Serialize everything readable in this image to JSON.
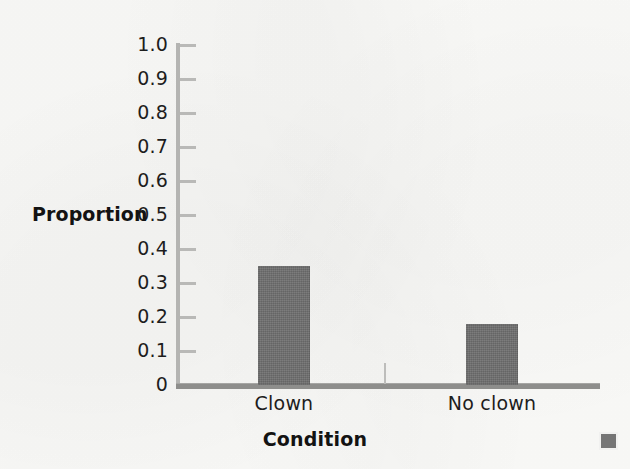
{
  "chart_data": {
    "type": "bar",
    "title": "",
    "subtitle": "",
    "categories": [
      "Clown",
      "No clown"
    ],
    "values": [
      0.35,
      0.18
    ],
    "series": [
      {
        "name": "Proportion",
        "values": [
          0.35,
          0.18
        ]
      }
    ],
    "xlabel": "Condition",
    "ylabel": "Proportion",
    "ylim": [
      0,
      1.0
    ],
    "ytick_labels": [
      "1.0",
      "0.9",
      "0.8",
      "0.7",
      "0.6",
      "0.5",
      "0.4",
      "0.3",
      "0.2",
      "0.1",
      "0"
    ],
    "ytick_values": [
      1.0,
      0.9,
      0.8,
      0.7,
      0.6,
      0.5,
      0.4,
      0.3,
      0.2,
      0.1,
      0
    ],
    "grid": false,
    "legend": false,
    "legend_position": "none",
    "annotations": [],
    "bar_color": "#6e6e6e",
    "axis_color": "#8e8e8c",
    "text_color": "#1d1d1d",
    "background_color": "#fbfbf9"
  },
  "axes": {
    "y_title": "Proportion",
    "x_title": "Condition"
  },
  "ticks": [
    {
      "label": "1.0",
      "value": 1.0
    },
    {
      "label": "0.9",
      "value": 0.9
    },
    {
      "label": "0.8",
      "value": 0.8
    },
    {
      "label": "0.7",
      "value": 0.7
    },
    {
      "label": "0.6",
      "value": 0.6
    },
    {
      "label": "0.5",
      "value": 0.5
    },
    {
      "label": "0.4",
      "value": 0.4
    },
    {
      "label": "0.3",
      "value": 0.3
    },
    {
      "label": "0.2",
      "value": 0.2
    },
    {
      "label": "0.1",
      "value": 0.1
    },
    {
      "label": "0",
      "value": 0
    }
  ],
  "bars": [
    {
      "category": "Clown",
      "value": 0.35
    },
    {
      "category": "No clown",
      "value": 0.18
    }
  ],
  "artifact": {
    "name": "scan-artifact-square",
    "color": "#757575"
  }
}
